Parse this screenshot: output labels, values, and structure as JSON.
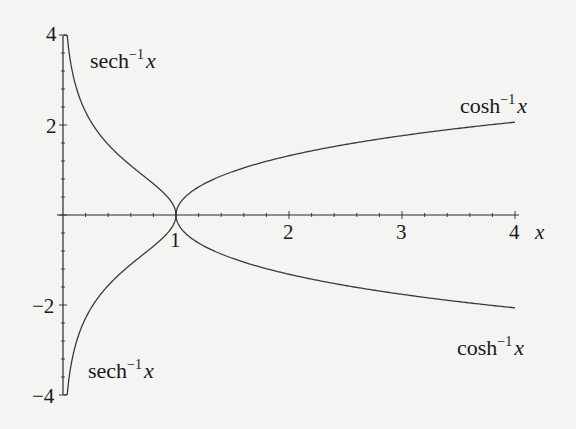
{
  "chart_data": {
    "type": "line",
    "title": "",
    "xlabel": "x",
    "ylabel": "",
    "xlim": [
      0,
      4
    ],
    "ylim": [
      -4,
      4
    ],
    "grid": false,
    "legend": "none (inline curve labels)",
    "x_ticks": [
      {
        "value": 1,
        "label": "1"
      },
      {
        "value": 2,
        "label": "2"
      },
      {
        "value": 3,
        "label": "3"
      },
      {
        "value": 4,
        "label": "4"
      }
    ],
    "y_ticks": [
      {
        "value": 4,
        "label": "4"
      },
      {
        "value": 2,
        "label": "2"
      },
      {
        "value": -2,
        "label": "−2"
      },
      {
        "value": -4,
        "label": "−4"
      }
    ],
    "series": [
      {
        "name": "sech^-1 x (upper)",
        "function": "arcsech",
        "sign": 1,
        "domain": [
          0,
          1
        ],
        "points": [
          [
            0.037,
            4.0
          ],
          [
            0.1,
            2.993
          ],
          [
            0.2,
            2.292
          ],
          [
            0.4,
            1.567
          ],
          [
            0.6,
            1.099
          ],
          [
            0.8,
            0.693
          ],
          [
            0.9,
            0.467
          ],
          [
            1.0,
            0.0
          ]
        ]
      },
      {
        "name": "sech^-1 x (lower)",
        "function": "arcsech",
        "sign": -1,
        "domain": [
          0,
          1
        ],
        "points": [
          [
            0.037,
            -4.0
          ],
          [
            0.1,
            -2.993
          ],
          [
            0.2,
            -2.292
          ],
          [
            0.4,
            -1.567
          ],
          [
            0.6,
            -1.099
          ],
          [
            0.8,
            -0.693
          ],
          [
            0.9,
            -0.467
          ],
          [
            1.0,
            0.0
          ]
        ]
      },
      {
        "name": "cosh^-1 x (upper)",
        "function": "arccosh",
        "sign": 1,
        "domain": [
          1,
          4
        ],
        "points": [
          [
            1.0,
            0.0
          ],
          [
            1.5,
            0.962
          ],
          [
            2.0,
            1.317
          ],
          [
            2.5,
            1.567
          ],
          [
            3.0,
            1.763
          ],
          [
            3.5,
            1.925
          ],
          [
            4.0,
            2.063
          ]
        ]
      },
      {
        "name": "cosh^-1 x (lower)",
        "function": "arccosh",
        "sign": -1,
        "domain": [
          1,
          4
        ],
        "points": [
          [
            1.0,
            0.0
          ],
          [
            1.5,
            -0.962
          ],
          [
            2.0,
            -1.317
          ],
          [
            2.5,
            -1.567
          ],
          [
            3.0,
            -1.763
          ],
          [
            3.5,
            -1.925
          ],
          [
            4.0,
            -2.063
          ]
        ]
      }
    ],
    "annotations": [
      {
        "text": "sech",
        "sup": "−1",
        "var": "x",
        "position": "upper-left"
      },
      {
        "text": "cosh",
        "sup": "−1",
        "var": "x",
        "position": "upper-right"
      },
      {
        "text": "sech",
        "sup": "−1",
        "var": "x",
        "position": "lower-left"
      },
      {
        "text": "cosh",
        "sup": "−1",
        "var": "x",
        "position": "lower-right"
      }
    ]
  },
  "labels": {
    "sech_upper": {
      "fn": "sech",
      "sup": "−1",
      "var": "x"
    },
    "cosh_upper": {
      "fn": "cosh",
      "sup": "−1",
      "var": "x"
    },
    "sech_lower": {
      "fn": "sech",
      "sup": "−1",
      "var": "x"
    },
    "cosh_lower": {
      "fn": "cosh",
      "sup": "−1",
      "var": "x"
    },
    "x_axis_label": "x",
    "x_tick_1": "1",
    "x_tick_2": "2",
    "x_tick_3": "3",
    "x_tick_4": "4",
    "y_tick_4": "4",
    "y_tick_2": "2",
    "y_tick_m2": "−2",
    "y_tick_m4": "−4"
  },
  "colors": {
    "background": "#f4f4f3",
    "curve": "#3a3a3a",
    "axis": "#2a2a2a"
  }
}
